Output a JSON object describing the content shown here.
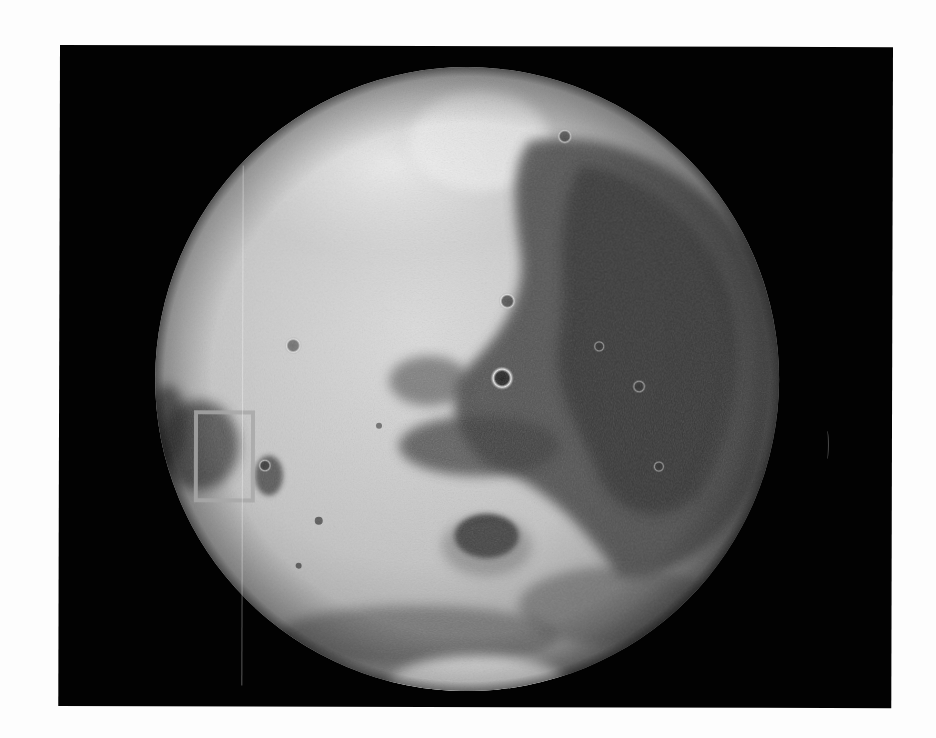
{
  "image": {
    "subject": "Mars",
    "description": "Grayscale photograph of a planet on a black background",
    "background_color": "#020202",
    "page_color": "#fdfdfd",
    "planet": {
      "center_x": 468,
      "center_y": 378,
      "radius": 312,
      "light_tone": "#d6d6d6",
      "dark_tone": "#3a3a3a"
    },
    "highlight_box": {
      "x": 196,
      "y": 412,
      "width": 58,
      "height": 88,
      "color": "#a8a8a8"
    }
  }
}
